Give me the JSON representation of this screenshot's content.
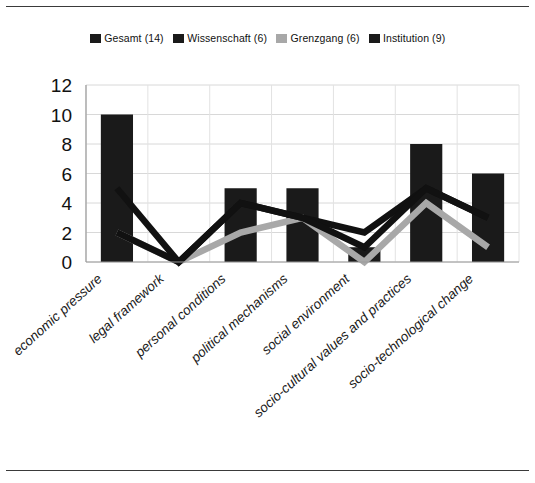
{
  "figure": {
    "background": "#ffffff",
    "rule_color": "#3a3a3a"
  },
  "legend": {
    "position": "top-center",
    "entries": [
      {
        "label": "Gesamt (14)",
        "color": "#1a1a1a",
        "marker": "square"
      },
      {
        "label": "Wissenschaft (6)",
        "color": "#1a1a1a",
        "marker": "square"
      },
      {
        "label": "Grenzgang (6)",
        "color": "#a8a8a8",
        "marker": "square"
      },
      {
        "label": "Institution (9)",
        "color": "#1a1a1a",
        "marker": "square"
      }
    ]
  },
  "chart_data": {
    "type": "bar",
    "title": "",
    "xlabel": "",
    "ylabel": "",
    "ylim": [
      0,
      12
    ],
    "yticks": [
      0,
      2,
      4,
      6,
      8,
      10,
      12
    ],
    "grid": true,
    "categories": [
      "economic pressure",
      "legal framework",
      "personal conditions",
      "political mechanisms",
      "social environment",
      "socio-cultural values and practices",
      "socio-technological change"
    ],
    "series": [
      {
        "name": "Gesamt (14)",
        "render": "bar",
        "color": "#1a1a1a",
        "values": [
          10,
          0,
          5,
          5,
          1,
          8,
          6
        ]
      },
      {
        "name": "Wissenschaft (6)",
        "render": "line",
        "color": "#111111",
        "values": [
          5,
          0,
          4,
          3,
          2,
          5,
          3
        ]
      },
      {
        "name": "Grenzgang (6)",
        "render": "line",
        "color": "#a8a8a8",
        "values": [
          2,
          0,
          2,
          3,
          0,
          4,
          1
        ]
      },
      {
        "name": "Institution (9)",
        "render": "line",
        "color": "#111111",
        "values": [
          2,
          0,
          4,
          3,
          1,
          5,
          3
        ]
      }
    ]
  }
}
